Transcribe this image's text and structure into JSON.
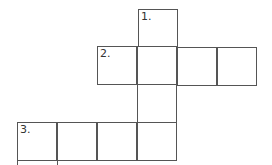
{
  "puzzle": {
    "type": "crossword",
    "cells": [
      {
        "id": "c1",
        "x": 138,
        "y": 9,
        "label": "1."
      },
      {
        "id": "c2",
        "x": 97,
        "y": 46,
        "label": "2."
      },
      {
        "id": "c3",
        "x": 137,
        "y": 46,
        "label": ""
      },
      {
        "id": "c4",
        "x": 177,
        "y": 47,
        "label": ""
      },
      {
        "id": "c5",
        "x": 217,
        "y": 47,
        "label": ""
      },
      {
        "id": "c6",
        "x": 137,
        "y": 84,
        "label": ""
      },
      {
        "id": "c7",
        "x": 17,
        "y": 122,
        "label": "3."
      },
      {
        "id": "c8",
        "x": 57,
        "y": 122,
        "label": ""
      },
      {
        "id": "c9",
        "x": 97,
        "y": 122,
        "label": ""
      },
      {
        "id": "c10",
        "x": 137,
        "y": 122,
        "label": ""
      }
    ],
    "labels": {
      "one": "1.",
      "two": "2.",
      "three": "3."
    },
    "line_color": "#555555"
  }
}
